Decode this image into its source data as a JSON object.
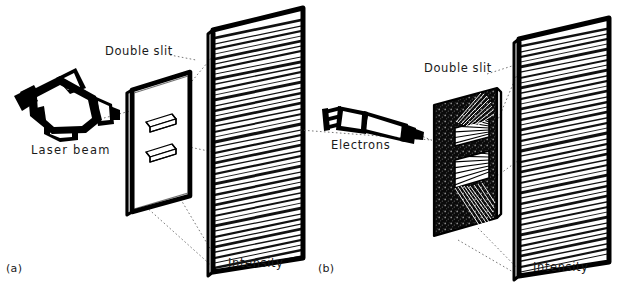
{
  "figure": {
    "background_color": "#ffffff",
    "ink_color": "#000000",
    "style": "hand-drawn line sketch"
  },
  "panels": [
    {
      "tag": "(a)",
      "name": "laser-double-slit",
      "source_label": "Laser  beam",
      "source_icon": "laser-pointer-icon",
      "slit_label": "Double slit",
      "slit_count": 2,
      "slit_plate_fill": "white",
      "screen_label": "Intensity",
      "fringe_pattern": "horizontal interference fringes",
      "fringe_count": 46
    },
    {
      "tag": "(b)",
      "name": "electron-double-slit",
      "source_label": "Electrons",
      "source_icon": "electron-gun-icon",
      "slit_label": "Double slit",
      "slit_count": 2,
      "slit_plate_fill": "stippled-black",
      "screen_label": "Intensity",
      "fringe_pattern": "horizontal interference fringes",
      "fringe_count": 44
    }
  ],
  "colors": {
    "ink": "#000000",
    "paper": "#ffffff",
    "leader_line": "#4a4a4a"
  }
}
